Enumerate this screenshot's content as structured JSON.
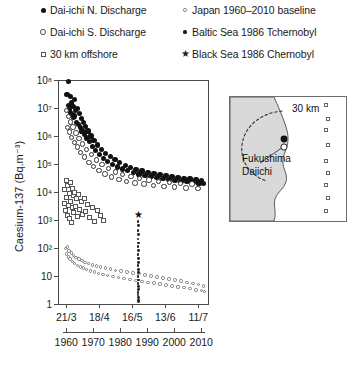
{
  "legend": {
    "items": [
      {
        "marker": "filled-circle",
        "label": "Dai-ichi N. Discharge",
        "col": 0,
        "row": 0
      },
      {
        "marker": "open-circle",
        "label": "Dai-ichi S. Discharge",
        "col": 0,
        "row": 1
      },
      {
        "marker": "open-square",
        "label": "30 km offshore",
        "col": 0,
        "row": 2
      },
      {
        "marker": "tiny-open-circle",
        "label": "Japan 1960–2010 baseline",
        "col": 1,
        "row": 0
      },
      {
        "marker": "tiny-dot",
        "label": "Baltic Sea 1986 Tchernobyl",
        "col": 1,
        "row": 1
      },
      {
        "marker": "star",
        "label": "Black Sea 1986 Chernobyl",
        "col": 1,
        "row": 2
      }
    ],
    "star_glyph": "★"
  },
  "inset": {
    "scale_label": "30 km",
    "site_label_line1": "Fukushima",
    "site_label_line2": "Daiichi",
    "offshore_marker_count": 9
  },
  "chart_data": {
    "type": "scatter",
    "title": "",
    "xlabel": "",
    "ylabel": "Caesium-137 (Bq.m⁻³)",
    "yscale": "log",
    "ylim": [
      1,
      100000000
    ],
    "ytick_labels": [
      "1",
      "10",
      "10²",
      "10³",
      "10⁴",
      "10⁵",
      "10⁶",
      "10⁷",
      "10⁸"
    ],
    "ytick_values": [
      1,
      10,
      100,
      1000,
      10000,
      100000,
      1000000,
      10000000,
      100000000
    ],
    "grid": false,
    "legend_position": "above-plot",
    "x_axes": [
      {
        "name": "date-axis-2011",
        "position": "primary-bottom",
        "tick_labels": [
          "21/3",
          "18/4",
          "16/5",
          "13/6",
          "11/7"
        ],
        "tick_fractions": [
          0.055,
          0.275,
          0.495,
          0.715,
          0.935
        ]
      },
      {
        "name": "year-axis",
        "position": "secondary-bottom",
        "tick_labels": [
          "1960",
          "1970",
          "1980",
          "1990",
          "2000",
          "2010"
        ],
        "tick_fractions": [
          0.055,
          0.235,
          0.415,
          0.595,
          0.775,
          0.955
        ]
      }
    ],
    "series": [
      {
        "name": "Dai-ichi N. Discharge",
        "marker": "filled-circle",
        "points": [
          [
            0.06,
            30000000
          ],
          [
            0.068,
            90000000
          ],
          [
            0.072,
            12000000
          ],
          [
            0.078,
            9000000
          ],
          [
            0.082,
            26000000
          ],
          [
            0.086,
            7000000
          ],
          [
            0.09,
            15000000
          ],
          [
            0.095,
            6000000
          ],
          [
            0.1,
            11000000
          ],
          [
            0.104,
            4500000
          ],
          [
            0.108,
            20000000
          ],
          [
            0.112,
            5200000
          ],
          [
            0.118,
            8000000
          ],
          [
            0.124,
            3000000
          ],
          [
            0.13,
            9500000
          ],
          [
            0.136,
            2600000
          ],
          [
            0.142,
            6500000
          ],
          [
            0.148,
            2000000
          ],
          [
            0.154,
            4200000
          ],
          [
            0.16,
            1500000
          ],
          [
            0.168,
            3000000
          ],
          [
            0.176,
            1100000
          ],
          [
            0.184,
            2200000
          ],
          [
            0.192,
            850000
          ],
          [
            0.2,
            1500000
          ],
          [
            0.21,
            620000
          ],
          [
            0.22,
            1000000
          ],
          [
            0.23,
            430000
          ],
          [
            0.24,
            700000
          ],
          [
            0.252,
            300000
          ],
          [
            0.264,
            480000
          ],
          [
            0.276,
            220000
          ],
          [
            0.29,
            330000
          ],
          [
            0.304,
            160000
          ],
          [
            0.318,
            240000
          ],
          [
            0.332,
            120000
          ],
          [
            0.348,
            180000
          ],
          [
            0.364,
            95000
          ],
          [
            0.38,
            140000
          ],
          [
            0.396,
            78000
          ],
          [
            0.412,
            110000
          ],
          [
            0.43,
            66000
          ],
          [
            0.448,
            90000
          ],
          [
            0.466,
            58000
          ],
          [
            0.484,
            76000
          ],
          [
            0.502,
            50000
          ],
          [
            0.52,
            64000
          ],
          [
            0.54,
            44000
          ],
          [
            0.56,
            56000
          ],
          [
            0.58,
            40000
          ],
          [
            0.6,
            50000
          ],
          [
            0.62,
            36000
          ],
          [
            0.64,
            46000
          ],
          [
            0.66,
            33000
          ],
          [
            0.68,
            42000
          ],
          [
            0.7,
            30000
          ],
          [
            0.72,
            38000
          ],
          [
            0.74,
            28000
          ],
          [
            0.76,
            35000
          ],
          [
            0.78,
            26000
          ],
          [
            0.8,
            33000
          ],
          [
            0.82,
            24000
          ],
          [
            0.84,
            31000
          ],
          [
            0.86,
            23000
          ],
          [
            0.88,
            29000
          ],
          [
            0.9,
            22000
          ],
          [
            0.92,
            28000
          ],
          [
            0.94,
            21000
          ],
          [
            0.958,
            26000
          ],
          [
            0.972,
            20000
          ]
        ]
      },
      {
        "name": "Dai-ichi S. Discharge",
        "marker": "open-circle",
        "points": [
          [
            0.058,
            8000000
          ],
          [
            0.064,
            2000000
          ],
          [
            0.07,
            5000000
          ],
          [
            0.076,
            1400000
          ],
          [
            0.084,
            3200000
          ],
          [
            0.092,
            900000
          ],
          [
            0.1,
            2100000
          ],
          [
            0.11,
            600000
          ],
          [
            0.12,
            1300000
          ],
          [
            0.13,
            400000
          ],
          [
            0.14,
            820000
          ],
          [
            0.152,
            260000
          ],
          [
            0.164,
            520000
          ],
          [
            0.178,
            175000
          ],
          [
            0.192,
            330000
          ],
          [
            0.206,
            115000
          ],
          [
            0.222,
            215000
          ],
          [
            0.238,
            80000
          ],
          [
            0.256,
            140000
          ],
          [
            0.274,
            58000
          ],
          [
            0.294,
            95000
          ],
          [
            0.314,
            44000
          ],
          [
            0.336,
            68000
          ],
          [
            0.358,
            34000
          ],
          [
            0.382,
            52000
          ],
          [
            0.406,
            28000
          ],
          [
            0.432,
            42000
          ],
          [
            0.458,
            24000
          ],
          [
            0.486,
            36000
          ],
          [
            0.514,
            21000
          ],
          [
            0.544,
            31000
          ],
          [
            0.574,
            19000
          ],
          [
            0.606,
            27000
          ],
          [
            0.638,
            17000
          ],
          [
            0.672,
            24000
          ],
          [
            0.706,
            16000
          ],
          [
            0.742,
            22000
          ],
          [
            0.778,
            15000
          ],
          [
            0.816,
            20000
          ],
          [
            0.854,
            14000
          ],
          [
            0.894,
            19000
          ],
          [
            0.934,
            13500
          ]
        ]
      },
      {
        "name": "30 km offshore",
        "marker": "open-square",
        "points": [
          [
            0.04,
            4000
          ],
          [
            0.046,
            12000
          ],
          [
            0.05,
            2200
          ],
          [
            0.054,
            26000
          ],
          [
            0.058,
            6500
          ],
          [
            0.062,
            1500
          ],
          [
            0.066,
            17000
          ],
          [
            0.07,
            3400
          ],
          [
            0.074,
            9000
          ],
          [
            0.078,
            1100
          ],
          [
            0.082,
            21000
          ],
          [
            0.086,
            4600
          ],
          [
            0.09,
            800
          ],
          [
            0.094,
            13000
          ],
          [
            0.098,
            2700
          ],
          [
            0.102,
            7200
          ],
          [
            0.106,
            1800
          ],
          [
            0.112,
            10000
          ],
          [
            0.118,
            3100
          ],
          [
            0.124,
            5800
          ],
          [
            0.13,
            1300
          ],
          [
            0.138,
            8200
          ],
          [
            0.146,
            2400
          ],
          [
            0.154,
            4400
          ],
          [
            0.164,
            1600
          ],
          [
            0.174,
            6000
          ],
          [
            0.186,
            2000
          ],
          [
            0.198,
            3600
          ],
          [
            0.212,
            1200
          ],
          [
            0.228,
            2800
          ],
          [
            0.244,
            900
          ],
          [
            0.262,
            2100
          ],
          [
            0.282,
            1400
          ],
          [
            0.304,
            1000
          ]
        ]
      },
      {
        "name": "Japan 1960–2010 baseline",
        "marker": "tiny-open-circle",
        "points": [
          [
            0.05,
            95
          ],
          [
            0.056,
            62
          ],
          [
            0.062,
            110
          ],
          [
            0.068,
            48
          ],
          [
            0.074,
            78
          ],
          [
            0.08,
            40
          ],
          [
            0.088,
            66
          ],
          [
            0.096,
            33
          ],
          [
            0.104,
            54
          ],
          [
            0.112,
            28
          ],
          [
            0.12,
            46
          ],
          [
            0.13,
            24
          ],
          [
            0.14,
            40
          ],
          [
            0.15,
            21
          ],
          [
            0.16,
            35
          ],
          [
            0.17,
            19
          ],
          [
            0.18,
            31
          ],
          [
            0.192,
            17
          ],
          [
            0.204,
            28
          ],
          [
            0.216,
            15
          ],
          [
            0.228,
            25
          ],
          [
            0.242,
            14
          ],
          [
            0.256,
            23
          ],
          [
            0.27,
            12.5
          ],
          [
            0.284,
            21
          ],
          [
            0.3,
            11.5
          ],
          [
            0.316,
            19
          ],
          [
            0.332,
            10.5
          ],
          [
            0.348,
            17.5
          ],
          [
            0.366,
            9.6
          ],
          [
            0.384,
            16
          ],
          [
            0.402,
            8.8
          ],
          [
            0.42,
            15
          ],
          [
            0.44,
            8.2
          ],
          [
            0.46,
            14
          ],
          [
            0.48,
            7.6
          ],
          [
            0.5,
            13
          ],
          [
            0.52,
            7.0
          ],
          [
            0.54,
            12
          ],
          [
            0.56,
            6.5
          ],
          [
            0.58,
            11
          ],
          [
            0.6,
            6.0
          ],
          [
            0.62,
            10
          ],
          [
            0.64,
            5.6
          ],
          [
            0.66,
            9.2
          ],
          [
            0.68,
            5.2
          ],
          [
            0.7,
            8.5
          ],
          [
            0.72,
            4.8
          ],
          [
            0.74,
            7.8
          ],
          [
            0.76,
            4.4
          ],
          [
            0.78,
            7.2
          ],
          [
            0.8,
            4.1
          ],
          [
            0.82,
            6.6
          ],
          [
            0.84,
            3.8
          ],
          [
            0.86,
            6.0
          ],
          [
            0.88,
            3.5
          ],
          [
            0.9,
            5.5
          ],
          [
            0.92,
            3.2
          ],
          [
            0.938,
            5.0
          ],
          [
            0.955,
            3.0
          ],
          [
            0.968,
            4.4
          ],
          [
            0.978,
            2.8
          ]
        ]
      },
      {
        "name": "Baltic Sea 1986 Tchernobyl",
        "marker": "tiny-dot",
        "points": [
          [
            0.533,
            900
          ],
          [
            0.535,
            620
          ],
          [
            0.533,
            430
          ],
          [
            0.536,
            300
          ],
          [
            0.534,
            210
          ],
          [
            0.537,
            150
          ],
          [
            0.534,
            110
          ],
          [
            0.536,
            80
          ],
          [
            0.533,
            58
          ],
          [
            0.537,
            42
          ],
          [
            0.535,
            31
          ],
          [
            0.534,
            23
          ],
          [
            0.536,
            17
          ],
          [
            0.535,
            13
          ],
          [
            0.533,
            9.5
          ],
          [
            0.537,
            7.2
          ],
          [
            0.534,
            5.5
          ],
          [
            0.536,
            4.2
          ],
          [
            0.535,
            3.3
          ],
          [
            0.534,
            2.6
          ],
          [
            0.533,
            2.1
          ],
          [
            0.537,
            1.7
          ],
          [
            0.535,
            1.4
          ],
          [
            0.536,
            1.2
          ]
        ]
      },
      {
        "name": "Black Sea 1986 Chernobyl",
        "marker": "star",
        "points": [
          [
            0.534,
            1400
          ]
        ]
      }
    ]
  }
}
